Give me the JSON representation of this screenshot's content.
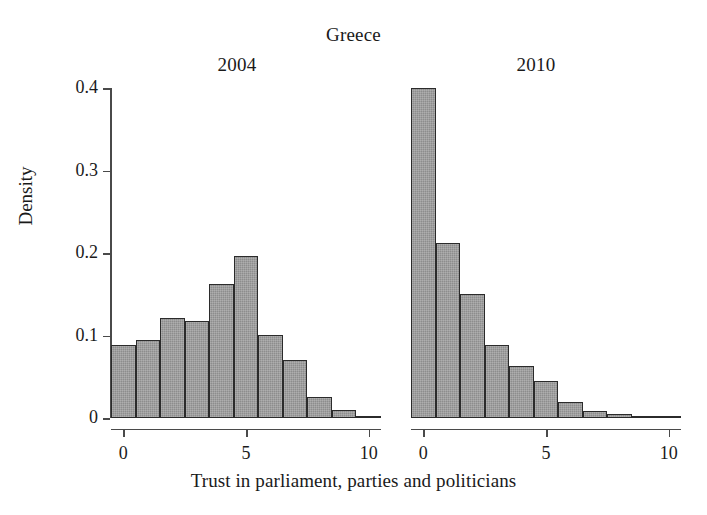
{
  "chart_data": {
    "type": "bar",
    "title": "Greece",
    "xlabel": "Trust in parliament, parties and politicians",
    "ylabel": "Density",
    "ylim": [
      0,
      0.4
    ],
    "xlim": [
      -0.5,
      10.5
    ],
    "grid": false,
    "legend": null,
    "ytick_labels": [
      "0",
      "0.1",
      "0.2",
      "0.3",
      "0.4"
    ],
    "ytick_values": [
      0,
      0.1,
      0.2,
      0.3,
      0.4
    ],
    "xtick_labels": [
      "0",
      "5",
      "10"
    ],
    "xtick_values": [
      0,
      5,
      10
    ],
    "categories": [
      0,
      1,
      2,
      3,
      4,
      5,
      6,
      7,
      8,
      9,
      10
    ],
    "panels": [
      {
        "label": "2004",
        "values": [
          0.089,
          0.095,
          0.121,
          0.117,
          0.162,
          0.196,
          0.101,
          0.07,
          0.025,
          0.01,
          0.003
        ]
      },
      {
        "label": "2010",
        "values": [
          0.4,
          0.212,
          0.15,
          0.089,
          0.063,
          0.045,
          0.019,
          0.008,
          0.005,
          0.003,
          0.002
        ]
      }
    ]
  }
}
